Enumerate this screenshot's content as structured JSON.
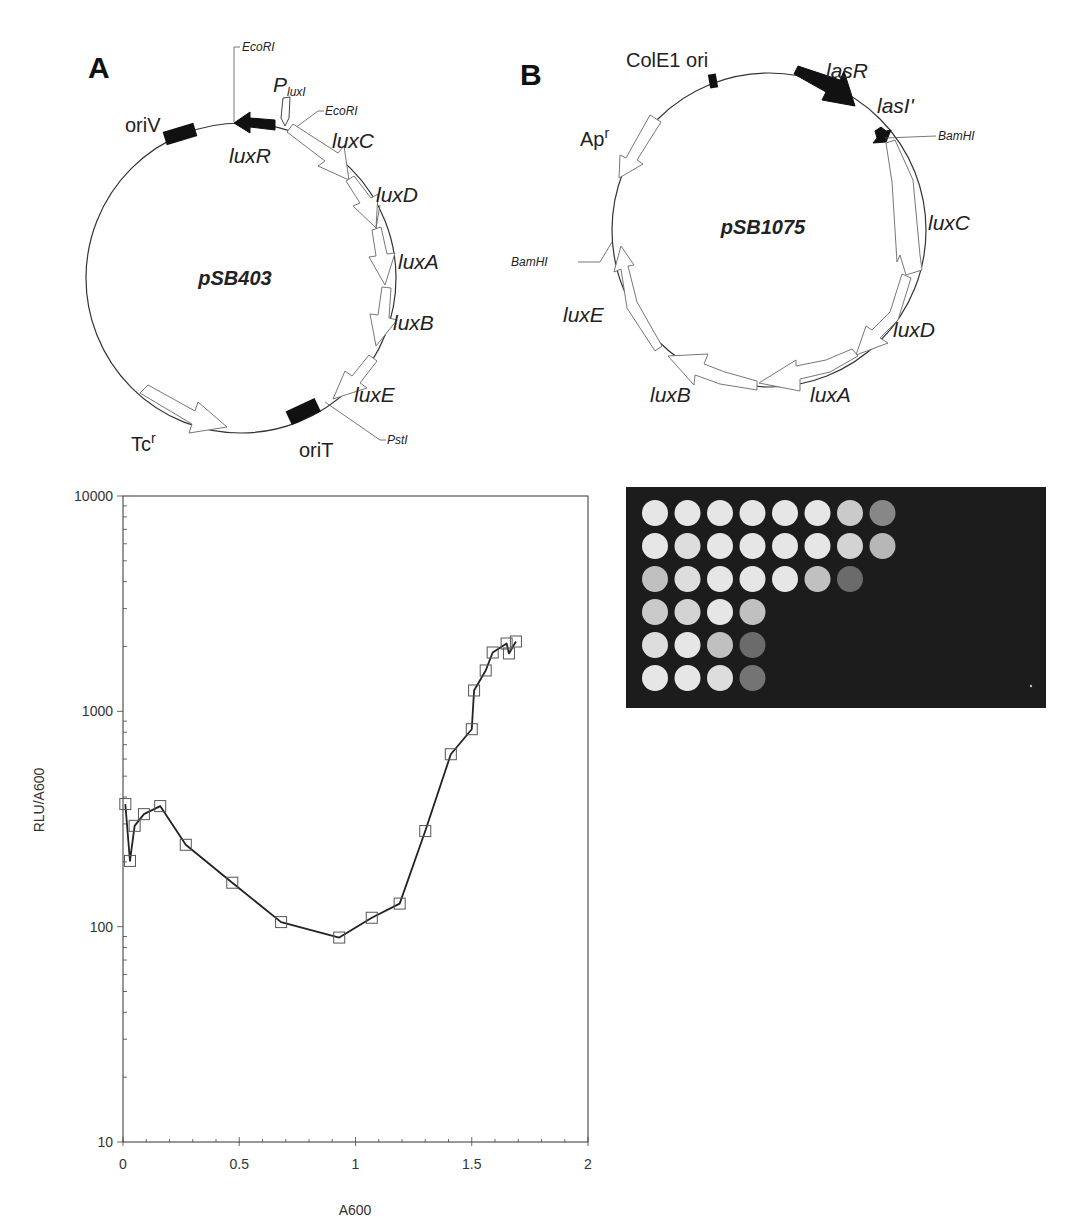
{
  "figure": {
    "panel_a": {
      "letter": "A",
      "plasmid": "pSB403",
      "features": {
        "oriV": "oriV",
        "luxR": "luxR",
        "pluxI_main": "P",
        "pluxI_sub": "luxI",
        "luxC": "luxC",
        "luxD": "luxD",
        "luxA": "luxA",
        "luxB": "luxB",
        "luxE": "luxE",
        "tc_main": "Tc",
        "tc_sup": "r",
        "oriT": "oriT"
      },
      "sites": {
        "ecori_1": "EcoRI",
        "ecori_2": "EcoRI",
        "psti": "PstI"
      }
    },
    "panel_b": {
      "letter": "B",
      "plasmid": "pSB1075",
      "features": {
        "cole1": "ColE1 ori",
        "lasR": "lasR",
        "lasI": "lasI'",
        "ap_main": "Ap",
        "ap_sup": "r",
        "luxC": "luxC",
        "luxD": "luxD",
        "luxA": "luxA",
        "luxB": "luxB",
        "luxE": "luxE"
      },
      "sites": {
        "bamhi_1": "BamHI",
        "bamhi_2": "BamHI"
      }
    },
    "plate": {
      "rows": [
        [
          1,
          1,
          1,
          1,
          1,
          1,
          0.85,
          0.5
        ],
        [
          1,
          0.95,
          1,
          1,
          1,
          1,
          0.9,
          0.75
        ],
        [
          0.8,
          0.95,
          1,
          1,
          1,
          0.8,
          0.35
        ],
        [
          0.85,
          0.9,
          1,
          0.8
        ],
        [
          0.95,
          1,
          0.8,
          0.35
        ],
        [
          1,
          1,
          0.95,
          0.4
        ]
      ]
    }
  },
  "chart_data": {
    "type": "line",
    "title": "",
    "xlabel": "A600",
    "ylabel": "RLU/A600",
    "yscale": "log",
    "xlim": [
      0,
      2
    ],
    "ylim": [
      10,
      10000
    ],
    "xticks": [
      "0",
      "0.5",
      "1",
      "1.5",
      "2"
    ],
    "yticks": [
      "10",
      "100",
      "1000",
      "10000"
    ],
    "grid": false,
    "legend": null,
    "marker": "open-square",
    "series": [
      {
        "name": "RLU/A600",
        "x": [
          0.01,
          0.03,
          0.05,
          0.09,
          0.16,
          0.27,
          0.47,
          0.68,
          0.93,
          1.07,
          1.19,
          1.3,
          1.41,
          1.5,
          1.51,
          1.56,
          1.59,
          1.65,
          1.66,
          1.69
        ],
        "y": [
          371,
          202,
          294,
          333,
          363,
          240,
          160,
          105,
          89,
          110,
          128,
          278,
          632,
          826,
          1250,
          1548,
          1876,
          2065,
          1857,
          2110
        ]
      }
    ]
  }
}
